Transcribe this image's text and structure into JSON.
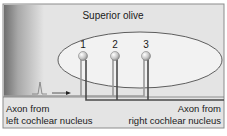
{
  "title": "Superior olive",
  "neurons": [
    {
      "label": "1",
      "x": 83
    },
    {
      "label": "2",
      "x": 115
    },
    {
      "label": "3",
      "x": 146
    }
  ],
  "left_axon": {
    "line1": "Axon from",
    "line2": "left cochlear nucleus"
  },
  "right_axon": {
    "line1": "Axon from",
    "line2": "right cochlear nucleus"
  },
  "colors": {
    "background": "#e4e4e4",
    "ellipse_fill": "#f2f2f2",
    "left_axon": "#9a9a9a",
    "right_axon": "#4a4a4a",
    "neuron": "#d0d0d0"
  }
}
